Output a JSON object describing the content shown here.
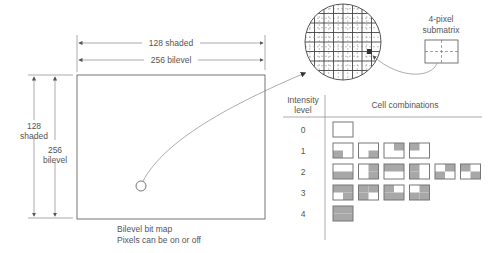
{
  "bitmap": {
    "width_labels": {
      "shaded": "128 shaded",
      "bilevel": "256 bilevel"
    },
    "height_labels": {
      "shaded_num": "128",
      "shaded_word": "shaded",
      "bilevel_num": "256",
      "bilevel_word": "bilevel"
    },
    "caption_line1": "Bilevel bit map",
    "caption_line2": "Pixels can be on or off"
  },
  "magnifier": {
    "grid_divisions": 8
  },
  "submatrix": {
    "label_line1": "4-pixel",
    "label_line2": "submatrix",
    "pixels": 4
  },
  "table": {
    "header_col1_line1": "Intensity",
    "header_col1_line2": "level",
    "header_col2": "Cell combinations",
    "shade_color": "#a8a8a8",
    "rows": [
      {
        "level": "0",
        "cells": [
          []
        ]
      },
      {
        "level": "1",
        "cells": [
          [
            "BL"
          ],
          [
            "BR"
          ],
          [
            "TR"
          ],
          [
            "TL"
          ]
        ]
      },
      {
        "level": "2",
        "cells": [
          [
            "BL",
            "BR"
          ],
          [
            "TR",
            "BR"
          ],
          [
            "TL",
            "TR"
          ],
          [
            "TL",
            "BL"
          ],
          [
            "TR",
            "BL"
          ],
          [
            "TL",
            "BR"
          ]
        ]
      },
      {
        "level": "3",
        "cells": [
          [
            "TL",
            "TR",
            "BR"
          ],
          [
            "TL",
            "TR",
            "BL"
          ],
          [
            "TL",
            "BL",
            "BR"
          ],
          [
            "TR",
            "BL",
            "BR"
          ]
        ]
      },
      {
        "level": "4",
        "cells": [
          [
            "TL",
            "TR",
            "BL",
            "BR"
          ]
        ]
      }
    ]
  }
}
